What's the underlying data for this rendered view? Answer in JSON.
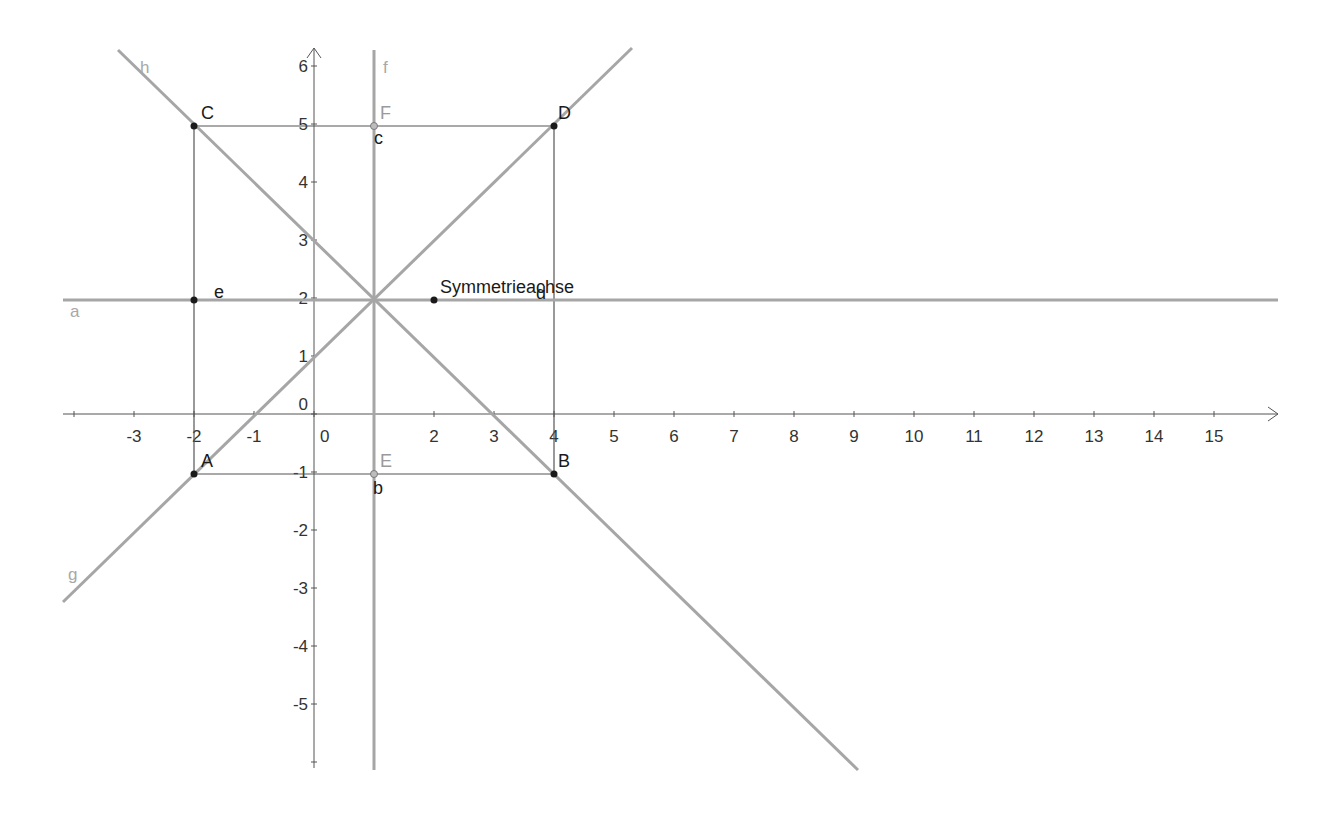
{
  "view": {
    "width": 1343,
    "height": 816,
    "origin_px": [
      314,
      414
    ],
    "unit_x_px": 60,
    "unit_y_px": 58
  },
  "colors": {
    "background": "#ffffff",
    "axis": "#555555",
    "thick_line": "#a6a6a6",
    "thin_segment": "#555555",
    "point_dark": "#1a1a1a",
    "point_grey": "#8c8c8c",
    "label_dark": "#1a1a1a",
    "label_grey": "#a8a8a8"
  },
  "axes": {
    "x_ticks": [
      {
        "value": -3,
        "label": "-3"
      },
      {
        "value": -2,
        "label": "-2"
      },
      {
        "value": -1,
        "label": "-1"
      },
      {
        "value": 0,
        "label": "0"
      },
      {
        "value": 2,
        "label": "2"
      },
      {
        "value": 3,
        "label": "3"
      },
      {
        "value": 4,
        "label": "4"
      },
      {
        "value": 5,
        "label": "5"
      },
      {
        "value": 6,
        "label": "6"
      },
      {
        "value": 7,
        "label": "7"
      },
      {
        "value": 8,
        "label": "8"
      },
      {
        "value": 9,
        "label": "9"
      },
      {
        "value": 10,
        "label": "10"
      },
      {
        "value": 11,
        "label": "11"
      },
      {
        "value": 12,
        "label": "12"
      },
      {
        "value": 13,
        "label": "13"
      },
      {
        "value": 14,
        "label": "14"
      },
      {
        "value": 15,
        "label": "15"
      }
    ],
    "y_ticks": [
      {
        "value": 6,
        "label": "6"
      },
      {
        "value": 5,
        "label": "5"
      },
      {
        "value": 4,
        "label": "4"
      },
      {
        "value": 3,
        "label": "3"
      },
      {
        "value": 2,
        "label": "2"
      },
      {
        "value": 1,
        "label": "1"
      },
      {
        "value": 0,
        "label": "0"
      },
      {
        "value": -1,
        "label": "-1"
      },
      {
        "value": -2,
        "label": "-2"
      },
      {
        "value": -3,
        "label": "-3"
      },
      {
        "value": -4,
        "label": "-4"
      },
      {
        "value": -5,
        "label": "-5"
      }
    ]
  },
  "points": [
    {
      "name": "A",
      "x": -2,
      "y": -1,
      "style": "dark"
    },
    {
      "name": "B",
      "x": 4,
      "y": -1,
      "style": "dark"
    },
    {
      "name": "C",
      "x": -2,
      "y": 5,
      "style": "dark"
    },
    {
      "name": "D",
      "x": 4,
      "y": 5,
      "style": "dark"
    },
    {
      "name": "E",
      "x": 1,
      "y": -1,
      "style": "grey"
    },
    {
      "name": "F",
      "x": 1,
      "y": 5,
      "style": "grey"
    },
    {
      "name": "",
      "x": -2,
      "y": 2,
      "style": "dark"
    },
    {
      "name": "",
      "x": 2,
      "y": 2,
      "style": "dark"
    }
  ],
  "lines": [
    {
      "name": "a",
      "equation": "y = 2"
    },
    {
      "name": "f",
      "equation": "x = 1"
    },
    {
      "name": "g",
      "equation": "y = x + 1"
    },
    {
      "name": "h",
      "equation": "y = -x + 3"
    }
  ],
  "segments": [
    {
      "name": "b",
      "from": "A",
      "to": "B"
    },
    {
      "name": "c",
      "from": "C",
      "to": "D"
    },
    {
      "name": "d",
      "from": "B",
      "to": "D"
    },
    {
      "name": "e",
      "from": "A",
      "to": "C"
    }
  ],
  "labels": {
    "A": "A",
    "B": "B",
    "C": "C",
    "D": "D",
    "E": "E",
    "F": "F",
    "a": "a",
    "f": "f",
    "g": "g",
    "h": "h",
    "b": "b",
    "c": "c",
    "d": "d",
    "e": "e",
    "text": "Symmetrieachse"
  }
}
